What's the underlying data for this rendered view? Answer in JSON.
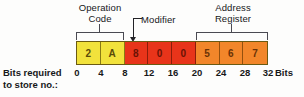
{
  "diagram": {
    "row_label": "Bits required\nto store no.:",
    "bits_unit": "Bits",
    "colors": {
      "yellow": "#f2e23c",
      "red": "#e8341a",
      "orange": "#f2862a",
      "bracket": "#4a4a52",
      "pointer": "#232327",
      "text": "#17181a"
    },
    "groups": [
      {
        "id": "operation-code",
        "label": "Operation\nCode",
        "start_bit": 0,
        "end_bit": 8
      },
      {
        "id": "modifier",
        "label": "Modifier",
        "start_bit": 8,
        "end_bit": 12
      },
      {
        "id": "address-register",
        "label": "Address\nRegister",
        "start_bit": 20,
        "end_bit": 32
      }
    ],
    "cells": [
      {
        "value": "2",
        "color": "yellow"
      },
      {
        "value": "A",
        "color": "yellow"
      },
      {
        "value": "8",
        "color": "red"
      },
      {
        "value": "0",
        "color": "red"
      },
      {
        "value": "0",
        "color": "red"
      },
      {
        "value": "5",
        "color": "orange"
      },
      {
        "value": "6",
        "color": "orange"
      },
      {
        "value": "7",
        "color": "orange"
      }
    ],
    "bit_ticks": [
      "0",
      "4",
      "8",
      "12",
      "16",
      "20",
      "24",
      "28",
      "32"
    ]
  }
}
